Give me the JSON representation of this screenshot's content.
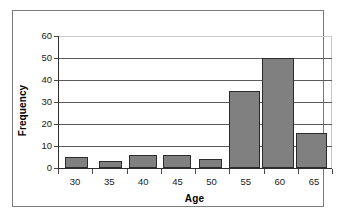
{
  "chart_data": {
    "type": "bar",
    "title": "",
    "xlabel": "Age",
    "ylabel": "Frequency",
    "categories": [
      "30",
      "35",
      "40",
      "45",
      "50",
      "55",
      "60",
      "65"
    ],
    "values": [
      5,
      3,
      6,
      6,
      4,
      35,
      50,
      16
    ],
    "series": [
      {
        "name": "Frequency",
        "values": [
          5,
          3,
          6,
          6,
          4,
          35,
          50,
          16
        ]
      }
    ],
    "ylim": [
      0,
      60
    ],
    "y_ticks": [
      "0",
      "10",
      "20",
      "30",
      "40",
      "50",
      "60"
    ],
    "y_tick_values": [
      0,
      10,
      20,
      30,
      40,
      50,
      60
    ],
    "x_ticks": [
      "30",
      "35",
      "40",
      "45",
      "50",
      "55",
      "60",
      "65"
    ],
    "grid": true,
    "grid_axis": "y",
    "legend": false,
    "legend_position": "none",
    "bar_fill_color": "#808080",
    "bar_border_color": "#2b2b2b",
    "plot_background_color": "#ffffff",
    "gridline_color": "#5a5a5a",
    "axis_color": "#2e2e2e",
    "frame_border_color": "#7a7a7a",
    "bar_layout": [
      {
        "category": "30",
        "value": 5,
        "left_pct": 2.2,
        "width_pct": 8.4
      },
      {
        "category": "35",
        "value": 3,
        "left_pct": 14.6,
        "width_pct": 8.4
      },
      {
        "category": "40",
        "value": 6,
        "left_pct": 25.6,
        "width_pct": 10.3
      },
      {
        "category": "45",
        "value": 6,
        "left_pct": 38.1,
        "width_pct": 10.3
      },
      {
        "category": "50",
        "value": 4,
        "left_pct": 51.2,
        "width_pct": 8.4
      },
      {
        "category": "55",
        "value": 35,
        "left_pct": 62.4,
        "width_pct": 11.3
      },
      {
        "category": "60",
        "value": 50,
        "left_pct": 74.5,
        "width_pct": 11.5
      },
      {
        "category": "65",
        "value": 16,
        "left_pct": 86.8,
        "width_pct": 11.3
      }
    ]
  }
}
